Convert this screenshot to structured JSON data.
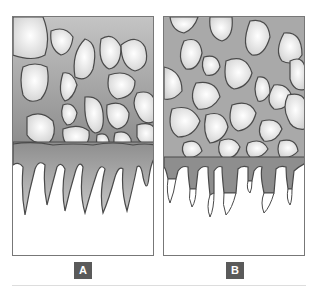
{
  "figure": {
    "panels": [
      {
        "id": "A",
        "label": "A",
        "description": "Particles embedded in matrix with a continuous basal layer and long tapering stalactite-like projections"
      },
      {
        "id": "B",
        "label": "B",
        "description": "Particles embedded in matrix with short projections ending in white pointed tips"
      }
    ],
    "colors": {
      "matrix": "#a9a9a9",
      "particle_fill": "#f2f2f2",
      "outline": "#4a4a4a",
      "label_bg": "#5a5a5a",
      "label_text": "#ffffff",
      "background": "#ffffff"
    }
  }
}
